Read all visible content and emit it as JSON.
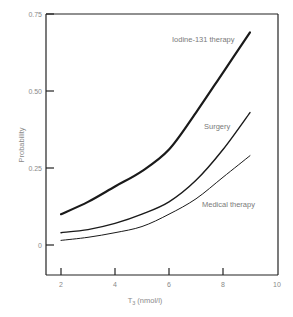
{
  "chart_data": {
    "type": "line",
    "title": "",
    "xlabel": "T3 (nmol/l)",
    "xlabel_main": "T",
    "xlabel_sub": "3",
    "xlabel_units": " (nmol/l)",
    "ylabel": "Probability",
    "xlim": [
      1.5,
      10
    ],
    "ylim": [
      -0.1,
      0.75
    ],
    "x_ticks": [
      2,
      4,
      6,
      8,
      10
    ],
    "x_tick_labels": [
      "2",
      "4",
      "6",
      "8",
      "10"
    ],
    "y_ticks": [
      0,
      0.25,
      0.5,
      0.75
    ],
    "y_tick_labels": [
      "0",
      "0.25",
      "0.50",
      "0.75"
    ],
    "grid": false,
    "legend": "none (inline annotations)",
    "x": [
      2,
      3,
      4,
      5,
      6,
      7,
      8,
      9
    ],
    "series": [
      {
        "name": "Iodine-131 therapy",
        "values": [
          0.1,
          0.14,
          0.19,
          0.24,
          0.31,
          0.43,
          0.56,
          0.69
        ],
        "stroke_width": 2.2
      },
      {
        "name": "Surgery",
        "values": [
          0.04,
          0.05,
          0.07,
          0.1,
          0.14,
          0.21,
          0.31,
          0.43
        ],
        "stroke_width": 1.4
      },
      {
        "name": "Medical therapy",
        "values": [
          0.015,
          0.025,
          0.04,
          0.06,
          0.1,
          0.15,
          0.22,
          0.29
        ],
        "stroke_width": 1.0
      }
    ],
    "annotations": [
      "Iodine-131 therapy",
      "Surgery",
      "Medical therapy"
    ]
  }
}
